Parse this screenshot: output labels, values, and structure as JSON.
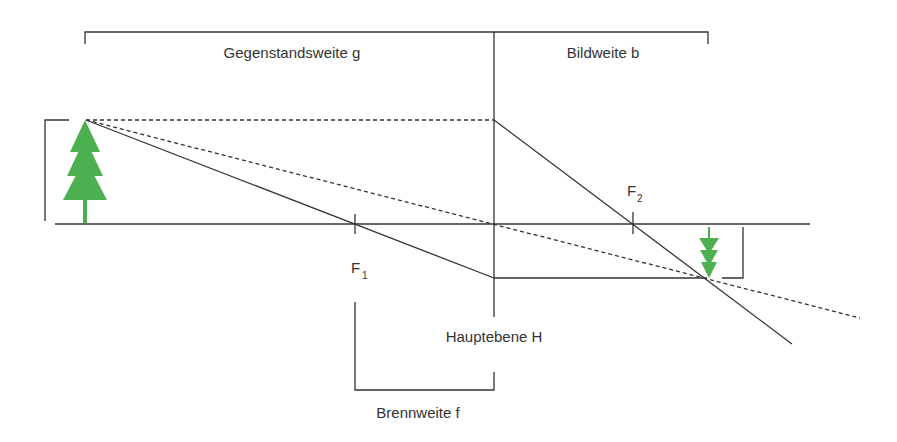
{
  "diagram": {
    "labels": {
      "object_distance": "Gegenstandsweite g",
      "image_distance": "Bildweite b",
      "principal_plane": "Hauptebene H",
      "focal_length": "Brennweite f",
      "focus1_main": "F",
      "focus1_sub": "1",
      "focus2_main": "F",
      "focus2_sub": "2"
    },
    "colors": {
      "line": "#333333",
      "tree": "#4caf50",
      "text": "#333333"
    },
    "elements": {
      "object": "upright-tree",
      "image": "inverted-tree"
    }
  }
}
